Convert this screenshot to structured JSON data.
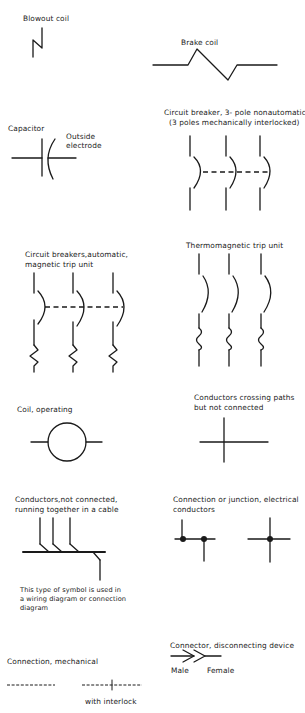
{
  "diagram": {
    "stroke_color": "#1a1a1a",
    "background": "#ffffff",
    "symbols": [
      {
        "id": "blowout-coil",
        "label": "Blowout coil"
      },
      {
        "id": "brake-coil",
        "label": "Brake coil"
      },
      {
        "id": "capacitor",
        "label": "Capacitor",
        "annotation_line1": "Outside",
        "annotation_line2": "electrode"
      },
      {
        "id": "circuit-breaker-3pole-nonautomatic",
        "label_line1": "Circuit breaker, 3- pole  nonautomatic",
        "label_line2": "(3 poles mechanically interlocked)"
      },
      {
        "id": "circuit-breakers-automatic-magnetic",
        "label_line1": "Circuit breakers,automatic,",
        "label_line2": "magnetic trip unit"
      },
      {
        "id": "thermomagnetic-trip-unit",
        "label": "Thermomagnetic trip unit"
      },
      {
        "id": "coil-operating",
        "label": "Coil, operating"
      },
      {
        "id": "conductors-crossing",
        "label_line1": "Conductors crossing paths",
        "label_line2": "but not connected"
      },
      {
        "id": "conductors-cable",
        "label_line1": "Conductors,not connected,",
        "label_line2": "running together in a cable",
        "note_line1": "This type of symbol is used in",
        "note_line2": "a wiring diagram or connection",
        "note_line3": "diagram"
      },
      {
        "id": "connection-junction",
        "label_line1": "Connection or junction, electrical",
        "label_line2": "conductors"
      },
      {
        "id": "connection-mechanical",
        "label": "Connection, mechanical",
        "sublabel": "with interlock"
      },
      {
        "id": "connector-disconnecting",
        "label": "Connector, disconnecting device",
        "male_label": "Male",
        "female_label": "Female"
      }
    ]
  }
}
